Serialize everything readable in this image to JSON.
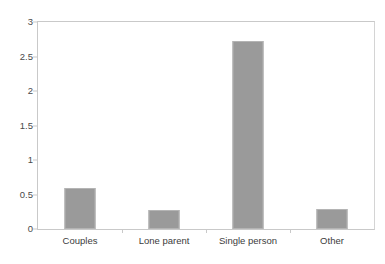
{
  "chart_data": {
    "type": "bar",
    "title": "",
    "subtitle": "",
    "xlabel": "",
    "ylabel": "",
    "categories": [
      "Couples",
      "Lone parent",
      "Single person",
      "Other"
    ],
    "values": [
      0.6,
      0.27,
      2.73,
      0.29
    ],
    "series": [
      {
        "name": "",
        "values": [
          0.6,
          0.27,
          2.73,
          0.29
        ]
      }
    ],
    "ylim": [
      0,
      3
    ],
    "yticks": [
      0,
      0.5,
      1,
      1.5,
      2,
      2.5,
      3
    ],
    "ytick_labels": [
      "0",
      "0.5",
      "1",
      "1.5",
      "2",
      "2.5",
      "3"
    ],
    "grid": false,
    "legend": false,
    "legend_position": "none",
    "annotations": [],
    "colors": {
      "bar_fill": "#9a9a9a",
      "bar_border": "#b4b4b4",
      "axis": "#c9c9c9",
      "tick_label": "#4a4a4a",
      "category_label": "#3c3c3c",
      "background": "#ffffff"
    }
  }
}
